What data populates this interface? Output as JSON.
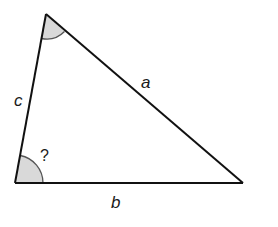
{
  "diagram": {
    "type": "triangle",
    "vertices": {
      "top": [
        46,
        14
      ],
      "bottom_left": [
        15,
        183
      ],
      "bottom_right": [
        243,
        183
      ]
    },
    "sides": [
      {
        "name": "a",
        "label": "a",
        "from": "top",
        "to": "bottom_right"
      },
      {
        "name": "b",
        "label": "b",
        "from": "bottom_left",
        "to": "bottom_right"
      },
      {
        "name": "c",
        "label": "c",
        "from": "top",
        "to": "bottom_left"
      }
    ],
    "angles": [
      {
        "vertex": "top",
        "marked": true,
        "label": ""
      },
      {
        "vertex": "bottom_left",
        "marked": true,
        "label": "?"
      }
    ],
    "colors": {
      "stroke": "#111111",
      "angle_fill": "#d9d9d9",
      "angle_stroke": "#555555"
    }
  }
}
